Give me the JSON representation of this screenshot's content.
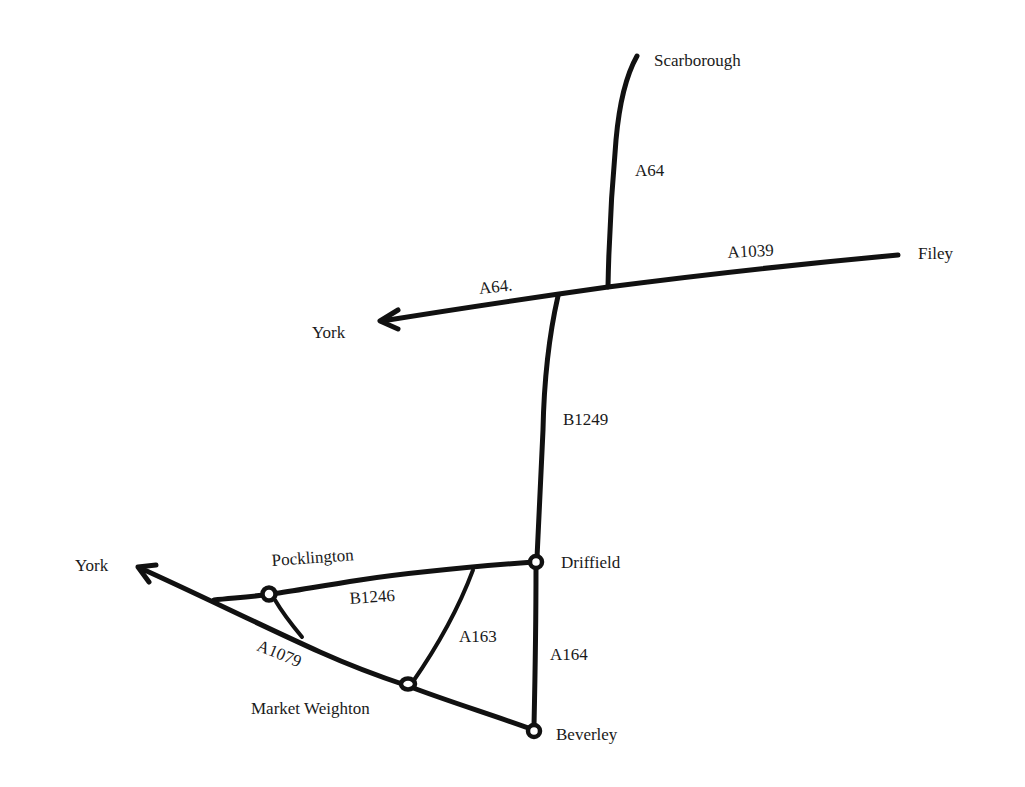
{
  "map": {
    "background": "#ffffff",
    "ink_color": "#111111",
    "places": {
      "scarborough": "Scarborough",
      "filey": "Filey",
      "york_north": "York",
      "york_south": "York",
      "pocklington": "Pocklington",
      "driffield": "Driffield",
      "market_weighton": "Market Weighton",
      "beverley": "Beverley"
    },
    "roads": {
      "a64_north": "A64",
      "a1039": "A1039",
      "a64_west": "A64.",
      "b1249": "B1249",
      "b1246": "B1246",
      "a163": "A163",
      "a164": "A164",
      "a1079": "A1079"
    },
    "icons": {
      "town_marker": "hollow-circle-icon",
      "direction_arrow": "arrow-head-icon"
    }
  }
}
